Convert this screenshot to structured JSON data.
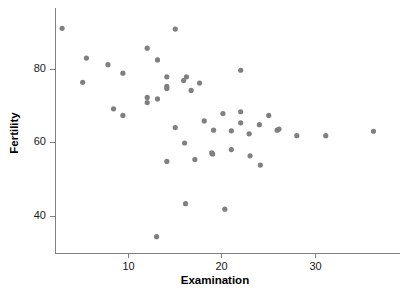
{
  "chart_data": {
    "type": "scatter",
    "title": "",
    "xlabel": "Examination",
    "ylabel": "Fertility",
    "xlim": [
      1.5,
      38.5
    ],
    "ylim": [
      32.0,
      94.5
    ],
    "xticks": [
      10,
      20,
      30
    ],
    "xticklabels": [
      "10",
      "20",
      "30"
    ],
    "yticks": [
      40,
      60,
      80
    ],
    "yticklabels": [
      "40",
      "60",
      "80"
    ],
    "grid": false,
    "legend": null,
    "marker": {
      "shape": "circle",
      "color": "#808080",
      "size": 2.6
    },
    "n_points": 47,
    "x": [
      2.9,
      15.0,
      12.0,
      5.5,
      7.8,
      9.4,
      5.1,
      13.1,
      22.0,
      14.1,
      16.2,
      14.1,
      14.1,
      15.9,
      17.6,
      16.7,
      12.0,
      12.0,
      13.1,
      8.4,
      9.4,
      18.1,
      20.1,
      22.0,
      22.0,
      24.0,
      25.0,
      26.1,
      15.0,
      19.1,
      21.0,
      22.9,
      16.0,
      25.9,
      28.0,
      31.1,
      18.9,
      21.0,
      23.0,
      36.2,
      14.1,
      16.1,
      17.1,
      19.0,
      20.3,
      24.1,
      13.0
    ],
    "y": [
      91.2,
      91.0,
      85.8,
      83.1,
      81.3,
      79.0,
      76.5,
      82.6,
      79.8,
      78.0,
      78.0,
      75.4,
      74.8,
      77.0,
      76.3,
      74.3,
      72.4,
      71.0,
      72.0,
      69.3,
      67.5,
      66.0,
      68.0,
      68.5,
      65.5,
      65.0,
      67.5,
      63.8,
      64.2,
      63.5,
      63.3,
      62.5,
      60.0,
      63.5,
      62.0,
      62.0,
      57.3,
      58.2,
      56.5,
      63.2,
      55.0,
      43.5,
      55.5,
      57.0,
      42.0,
      54.0,
      34.5
    ]
  },
  "axes": {
    "y_label": "Fertility",
    "x_label": "Examination",
    "y_tick_80": "80",
    "y_tick_60": "60",
    "y_tick_40": "40",
    "x_tick_10": "10",
    "x_tick_20": "20",
    "x_tick_30": "30"
  },
  "colors": {
    "point": "#808080",
    "axis": "#808080",
    "text": "#000000",
    "background": "#ffffff"
  }
}
